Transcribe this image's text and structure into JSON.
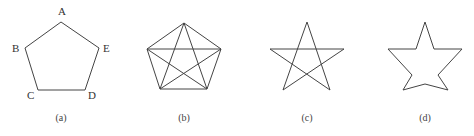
{
  "diagram": {
    "stroke_color": "#444444",
    "background": "#ffffff",
    "figures": [
      {
        "id": "a",
        "caption": "(a)",
        "description": "Regular pentagon with labeled vertices",
        "vertices": {
          "A": [
            61,
            22
          ],
          "E": [
            99,
            48
          ],
          "D": [
            85,
            90
          ],
          "C": [
            38,
            90
          ],
          "B": [
            25,
            48
          ]
        },
        "labels": {
          "A": "A",
          "B": "B",
          "C": "C",
          "D": "D",
          "E": "E"
        }
      },
      {
        "id": "b",
        "caption": "(b)",
        "description": "Pentagon with all diagonals (complete graph K5)",
        "vertices": [
          [
            184,
            23
          ],
          [
            221,
            49
          ],
          [
            207,
            89
          ],
          [
            160,
            89
          ],
          [
            147,
            49
          ]
        ]
      },
      {
        "id": "c",
        "caption": "(c)",
        "description": "Pentagram drawn with crossing lines",
        "vertices": [
          [
            307,
            22
          ],
          [
            344,
            49
          ],
          [
            330,
            90
          ],
          [
            283,
            90
          ],
          [
            270,
            49
          ]
        ]
      },
      {
        "id": "d",
        "caption": "(d)",
        "description": "Star outline (five-pointed star)",
        "outline": [
          [
            425,
            22
          ],
          [
            434,
            49
          ],
          [
            462,
            49
          ],
          [
            438,
            75
          ],
          [
            448,
            90
          ],
          [
            425,
            84
          ],
          [
            403,
            90
          ],
          [
            412,
            75
          ],
          [
            388,
            49
          ],
          [
            416,
            49
          ]
        ]
      }
    ]
  }
}
